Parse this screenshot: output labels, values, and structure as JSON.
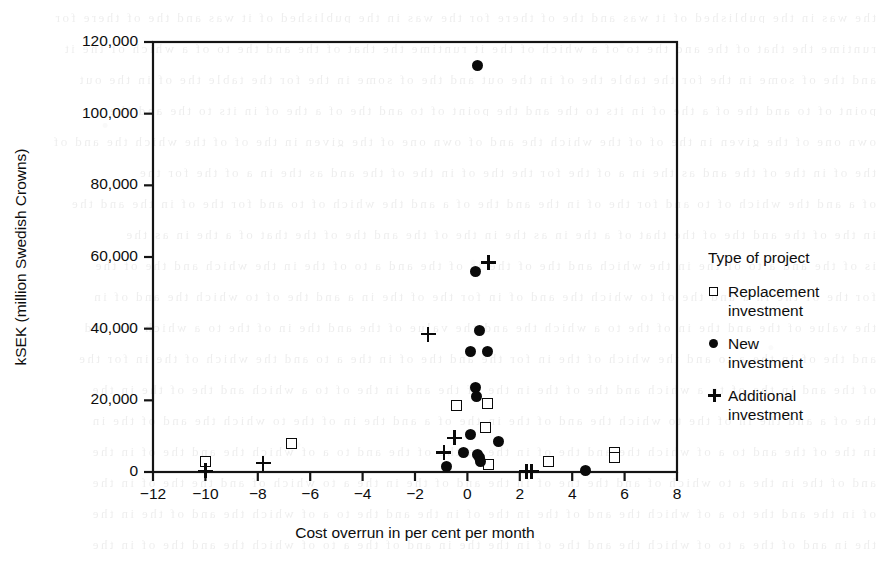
{
  "chart_data": {
    "type": "scatter",
    "title": "",
    "xlabel": "Cost overrun in per cent per month",
    "ylabel": "kSEK (million Swedish Crowns)",
    "xlim": [
      -12,
      8
    ],
    "ylim": [
      0,
      120000
    ],
    "xticks": [
      "-12",
      "-10",
      "-8",
      "-6",
      "-4",
      "-2",
      "0",
      "2",
      "4",
      "6",
      "8"
    ],
    "xtick_values": [
      -12,
      -10,
      -8,
      -6,
      -4,
      -2,
      0,
      2,
      4,
      6,
      8
    ],
    "yticks": [
      "0",
      "20,000",
      "40,000",
      "60,000",
      "80,000",
      "100,000",
      "120,000"
    ],
    "ytick_values": [
      0,
      20000,
      40000,
      60000,
      80000,
      100000,
      120000
    ],
    "grid": false,
    "legend_position": "right",
    "legend_title": "Type of project",
    "series": [
      {
        "name": "Replacement investment",
        "marker": "open-square",
        "color": "#0a0a0a",
        "points": [
          [
            -10.0,
            3000
          ],
          [
            -6.7,
            8000
          ],
          [
            -0.4,
            18500
          ],
          [
            0.75,
            19000
          ],
          [
            0.7,
            12500
          ],
          [
            0.8,
            2000
          ],
          [
            3.1,
            3000
          ],
          [
            5.6,
            5500
          ],
          [
            5.6,
            4000
          ]
        ]
      },
      {
        "name": "New investment",
        "marker": "filled-circle",
        "color": "#0a0a0a",
        "points": [
          [
            0.4,
            113500
          ],
          [
            0.3,
            56000
          ],
          [
            0.45,
            39500
          ],
          [
            0.1,
            33500
          ],
          [
            0.75,
            33500
          ],
          [
            0.3,
            23500
          ],
          [
            0.35,
            21000
          ],
          [
            0.1,
            10500
          ],
          [
            1.2,
            8500
          ],
          [
            -0.15,
            5500
          ],
          [
            0.4,
            5000
          ],
          [
            0.45,
            4000
          ],
          [
            0.5,
            3000
          ],
          [
            -0.8,
            1500
          ],
          [
            4.5,
            300
          ]
        ]
      },
      {
        "name": "Additional investment",
        "marker": "plus",
        "color": "#0a0a0a",
        "points": [
          [
            0.8,
            58500
          ],
          [
            -1.5,
            38500
          ],
          [
            -0.5,
            9500
          ],
          [
            -0.9,
            5500
          ],
          [
            -10.0,
            300
          ],
          [
            -7.8,
            2500
          ],
          [
            2.25,
            100
          ],
          [
            2.45,
            100
          ]
        ]
      }
    ]
  },
  "legend": {
    "title": "Type of project",
    "entries": [
      {
        "marker": "open-square",
        "line1": "Replacement",
        "line2": "investment"
      },
      {
        "marker": "filled-circle",
        "line1": "New",
        "line2": "investment"
      },
      {
        "marker": "plus",
        "line1": "Additional",
        "line2": "investment"
      }
    ]
  },
  "background_bleed_lines": [
    "the  was  in  the  published  of  it  was  and  the  of  there  for",
    "runtime  the  that  of  the  and  the  to  of  a  which  of  the  it",
    "and  the  of  some  in  the  for  the  table  the  of  in  the  out",
    "point  of  to  and  the  of  a  the  of  in  its  to  the  and  the",
    "own  one  of  the  given  in  the  of  of  the  which  the  and  of",
    "the  of  in  the  of  the  and  as  the  in  a  of  the  for  the",
    "of  a  and  the  which  of  to  and  for  the  of  in  the  and  the",
    "in  the  of  the  and  the  of  the  that  of  a  the  in  as  the",
    "is  of  the  and  a  to  of  the  in  the  which  and  the  of  the",
    "for  the  of  the  in  a  and  the  of  to  which  the  and  of  in",
    "the  value  of  the  and  the  in  of  the  to  a  which  the  and",
    "and  the  of  in  the  a  to  and  the  which  of  the  in  for  the",
    "of  the  and  in  the  of  to  a  which  and  the  of  the  in  the",
    "the  of  a  and  the  in  of  the  to  which  the  and  of  the  in",
    "in  the  of  the  and  to  a  of  which  the  and  the  of  in  the",
    "and  of  the  in  the  a  to  which  of  and  the  the  of  in  the",
    "of  in  the  and  the  to  a  of  which  the  and  of  the  in  the",
    "the  in  and  of  the  a  to  of  which  the  and  the  of  in  the"
  ]
}
